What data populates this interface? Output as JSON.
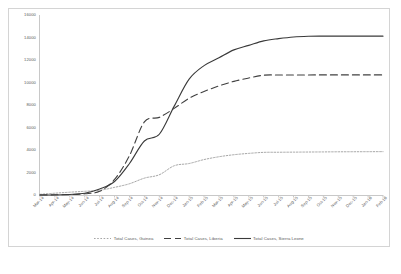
{
  "chart_data": {
    "type": "line",
    "title": "",
    "xlabel": "",
    "ylabel": "",
    "ylim": [
      0,
      16000
    ],
    "ytick_step": 2000,
    "grid": false,
    "legend_position": "bottom",
    "yticks": [
      "0",
      "2000",
      "4000",
      "6000",
      "8000",
      "10000",
      "12000",
      "14000",
      "16000"
    ],
    "categories": [
      "Mar-14",
      "Apr-14",
      "May-14",
      "Jun-14",
      "Jul-14",
      "Aug-14",
      "Sep-14",
      "Oct-14",
      "Nov-14",
      "Dec-14",
      "Jan-15",
      "Feb-15",
      "Mar-15",
      "Apr-15",
      "May-15",
      "Jun-15",
      "Jul-15",
      "Aug-15",
      "Sep-15",
      "Oct-15",
      "Nov-15",
      "Dec-15",
      "Jan-16",
      "Feb-16"
    ],
    "series": [
      {
        "name": "Total Cases, Guinea",
        "style": "dotted",
        "color": "#7f7f7f",
        "values": [
          60,
          160,
          250,
          330,
          420,
          680,
          1000,
          1500,
          1800,
          2600,
          2800,
          3150,
          3400,
          3580,
          3700,
          3790,
          3800,
          3810,
          3820,
          3830,
          3840,
          3845,
          3850,
          3855
        ]
      },
      {
        "name": "Total Cases, Liberia",
        "style": "dashed",
        "color": "#404040",
        "values": [
          0,
          20,
          40,
          110,
          330,
          1380,
          3500,
          6500,
          6900,
          7700,
          8600,
          9200,
          9700,
          10100,
          10400,
          10650,
          10670,
          10672,
          10673,
          10675,
          10675,
          10675,
          10675,
          10675
        ]
      },
      {
        "name": "Total Cases, Sierra Leone",
        "style": "solid",
        "color": "#3a3a3a",
        "values": [
          0,
          0,
          50,
          160,
          530,
          1200,
          2800,
          4800,
          5400,
          7900,
          10300,
          11500,
          12200,
          12900,
          13300,
          13700,
          13900,
          14050,
          14110,
          14120,
          14122,
          14122,
          14122,
          14122
        ]
      }
    ]
  }
}
